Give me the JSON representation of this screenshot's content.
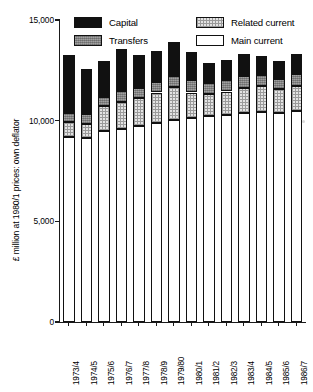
{
  "chart": {
    "type": "bar",
    "title": "",
    "ylabel": "£ million at 1980/1 prices: own deflator",
    "xlabel": ""
  },
  "legend": {
    "position": "top-inside",
    "entries": [
      {
        "label": "Capital",
        "key": "capital",
        "swatch": "black-solid"
      },
      {
        "label": "Related current",
        "key": "related",
        "swatch": "light-stipple"
      },
      {
        "label": "Transfers",
        "key": "transfers",
        "swatch": "grey-stipple"
      },
      {
        "label": "Main current",
        "key": "main",
        "swatch": "white-empty"
      }
    ]
  },
  "yaxis": {
    "min": 0,
    "max": 15000,
    "ticks": [
      0,
      5000,
      10000,
      15000
    ],
    "tick_labels": [
      "0",
      "5,000",
      "10,000",
      "15,000"
    ]
  },
  "chart_data": {
    "type": "bar",
    "stacked": true,
    "title": "",
    "xlabel": "",
    "ylabel": "£ million at 1980/1 prices: own deflator",
    "ylim": [
      0,
      15000
    ],
    "yticks": [
      0,
      5000,
      10000,
      15000
    ],
    "grid": false,
    "legend_position": "top-inside",
    "categories": [
      "1973/4",
      "1974/5",
      "1975/6",
      "1976/7",
      "1977/8",
      "1978/9",
      "1979/80",
      "1980/1",
      "1981/2",
      "1982/3",
      "1983/4",
      "1984/5",
      "1985/6",
      "1986/7"
    ],
    "stack_order_bottom_to_top": [
      "main",
      "related",
      "transfers",
      "capital"
    ],
    "series": [
      {
        "name": "Main current",
        "key": "main",
        "swatch": "white-empty",
        "values": [
          9200,
          9150,
          9500,
          9600,
          9750,
          9900,
          10050,
          10150,
          10250,
          10300,
          10400,
          10450,
          10400,
          10500
        ]
      },
      {
        "name": "Related current",
        "key": "related",
        "swatch": "light-stipple",
        "values": [
          750,
          700,
          1250,
          1350,
          1400,
          1500,
          1600,
          1250,
          1100,
          1150,
          1200,
          1250,
          1150,
          1200
        ]
      },
      {
        "name": "Transfers",
        "key": "transfers",
        "swatch": "grey-stipple",
        "values": [
          450,
          500,
          450,
          500,
          450,
          500,
          550,
          600,
          500,
          550,
          600,
          550,
          500,
          600
        ]
      },
      {
        "name": "Capital",
        "key": "capital",
        "swatch": "black-solid",
        "values": [
          2850,
          2200,
          1750,
          2100,
          1650,
          1550,
          1700,
          1400,
          1000,
          1000,
          1100,
          950,
          900,
          1000
        ]
      }
    ],
    "totals": [
      13250,
      12550,
      12950,
      13550,
      13250,
      13450,
      13900,
      13400,
      12850,
      13000,
      13300,
      13200,
      12950,
      13300
    ]
  }
}
